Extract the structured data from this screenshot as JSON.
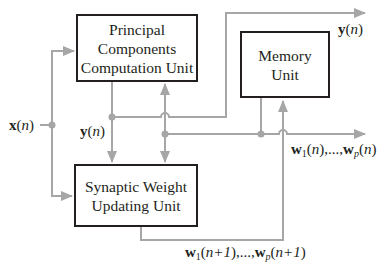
{
  "diagram": {
    "colors": {
      "wire": "#a6a6a6",
      "box_border": "#231f20",
      "text": "#231f20",
      "background": "#ffffff"
    },
    "blocks": {
      "pccu": {
        "lines": [
          "Principal",
          "Components",
          "Computation Unit"
        ]
      },
      "memory": {
        "lines": [
          "Memory",
          "Unit"
        ]
      },
      "swuu": {
        "lines": [
          "Synaptic Weight",
          "Updating Unit"
        ]
      }
    },
    "labels": {
      "input": {
        "vec": "x",
        "arg": "n"
      },
      "y_internal": {
        "vec": "y",
        "arg": "n"
      },
      "y_output": {
        "vec": "y",
        "arg": "n"
      },
      "w_current": {
        "vec": "w",
        "sub1": "1",
        "sub2": "p",
        "arg": "n",
        "sep": ",...,"
      },
      "w_next": {
        "vec": "w",
        "sub1": "1",
        "sub2": "p",
        "arg": "n+1",
        "sep": ",...,"
      }
    },
    "connections": [
      "x(n) -> Principal Components Computation Unit",
      "x(n) -> Synaptic Weight Updating Unit",
      "Principal Components Computation Unit -> y(n) -> Synaptic Weight Updating Unit",
      "y(n) -> output",
      "Memory Unit -> w1(n),...,wp(n) -> Principal Components Computation Unit",
      "w1(n),...,wp(n) -> Synaptic Weight Updating Unit",
      "w1(n),...,wp(n) -> output",
      "Synaptic Weight Updating Unit -> w1(n+1),...,wp(n+1) -> Memory Unit"
    ]
  }
}
